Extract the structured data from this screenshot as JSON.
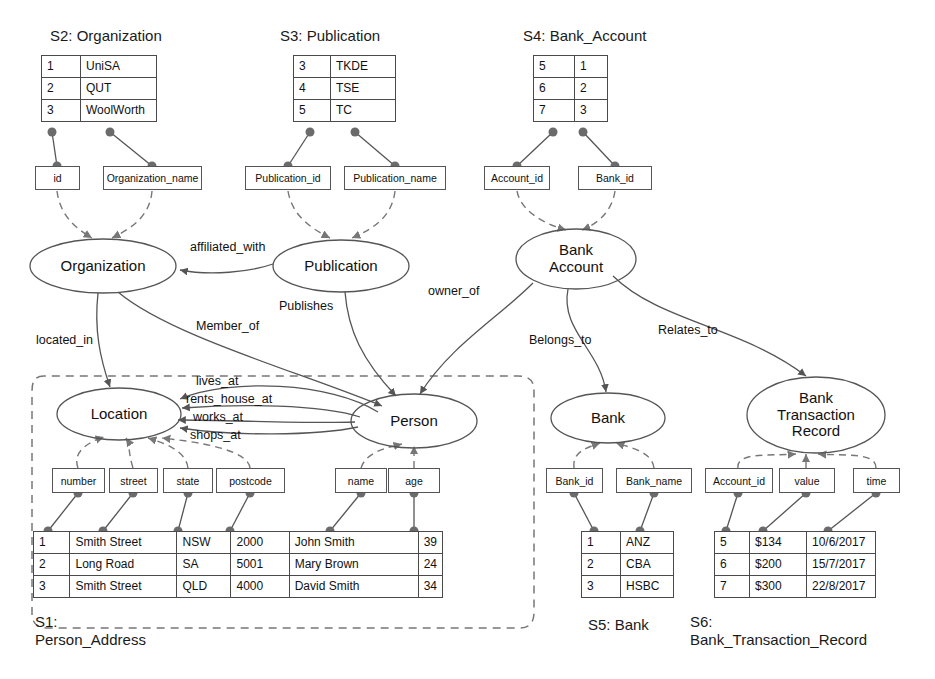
{
  "diagram": {
    "colors": {
      "stroke": "#555555",
      "node_dot": "#6b6b6b",
      "dashed": "#777777",
      "text": "#111111"
    }
  },
  "schemas": [
    {
      "id": "S1",
      "caption_line1": "S1:",
      "caption_line2": "Person_Address",
      "rows": [
        [
          "1",
          "Smith Street",
          "NSW",
          "2000",
          "John Smith",
          "39"
        ],
        [
          "2",
          "Long Road",
          "SA",
          "5001",
          "Mary Brown",
          "24"
        ],
        [
          "3",
          "Smith Street",
          "QLD",
          "4000",
          "David Smith",
          "34"
        ]
      ]
    },
    {
      "id": "S2",
      "caption": "S2: Organization",
      "rows": [
        [
          "1",
          "UniSA"
        ],
        [
          "2",
          "QUT"
        ],
        [
          "3",
          "WoolWorth"
        ]
      ]
    },
    {
      "id": "S3",
      "caption": "S3: Publication",
      "rows": [
        [
          "3",
          "TKDE"
        ],
        [
          "4",
          "TSE"
        ],
        [
          "5",
          "TC"
        ]
      ]
    },
    {
      "id": "S4",
      "caption": "S4: Bank_Account",
      "rows": [
        [
          "5",
          "1"
        ],
        [
          "6",
          "2"
        ],
        [
          "7",
          "3"
        ]
      ]
    },
    {
      "id": "S5",
      "caption": "S5: Bank",
      "rows": [
        [
          "1",
          "ANZ"
        ],
        [
          "2",
          "CBA"
        ],
        [
          "3",
          "HSBC"
        ]
      ]
    },
    {
      "id": "S6",
      "caption_line1": "S6:",
      "caption_line2": "Bank_Transaction_Record",
      "rows": [
        [
          "5",
          "$134",
          "10/6/2017"
        ],
        [
          "6",
          "$200",
          "15/7/2017"
        ],
        [
          "7",
          "$300",
          "22/8/2017"
        ]
      ]
    }
  ],
  "attributes": [
    {
      "key": "id",
      "label": "id"
    },
    {
      "key": "organization_name",
      "label": "Organization_name"
    },
    {
      "key": "publication_id",
      "label": "Publication_id"
    },
    {
      "key": "publication_name",
      "label": "Publication_name"
    },
    {
      "key": "account_id_top",
      "label": "Account_id"
    },
    {
      "key": "bank_id_top",
      "label": "Bank_id"
    },
    {
      "key": "number",
      "label": "number"
    },
    {
      "key": "street",
      "label": "street"
    },
    {
      "key": "state",
      "label": "state"
    },
    {
      "key": "postcode",
      "label": "postcode"
    },
    {
      "key": "name",
      "label": "name"
    },
    {
      "key": "age",
      "label": "age"
    },
    {
      "key": "bank_id",
      "label": "Bank_id"
    },
    {
      "key": "bank_name",
      "label": "Bank_name"
    },
    {
      "key": "account_id",
      "label": "Account_id"
    },
    {
      "key": "value",
      "label": "value"
    },
    {
      "key": "time",
      "label": "time"
    }
  ],
  "entities": [
    {
      "key": "organization",
      "label": "Organization"
    },
    {
      "key": "publication",
      "label": "Publication"
    },
    {
      "key": "bank_account",
      "label": "Bank\nAccount"
    },
    {
      "key": "location",
      "label": "Location"
    },
    {
      "key": "person",
      "label": "Person"
    },
    {
      "key": "bank",
      "label": "Bank"
    },
    {
      "key": "bank_transaction_record",
      "label": "Bank\nTransaction\nRecord"
    }
  ],
  "relationships": [
    {
      "key": "affiliated_with",
      "label": "affiliated_with",
      "from": "publication",
      "to": "organization"
    },
    {
      "key": "publishes",
      "label": "Publishes",
      "from": "publication",
      "to": "person"
    },
    {
      "key": "owner_of",
      "label": "owner_of",
      "from": "bank_account",
      "to": "person"
    },
    {
      "key": "located_in",
      "label": "located_in",
      "from": "organization",
      "to": "location"
    },
    {
      "key": "member_of",
      "label": "Member_of",
      "from": "organization",
      "to": "person"
    },
    {
      "key": "lives_at",
      "label": "lives_at",
      "from": "person",
      "to": "location"
    },
    {
      "key": "rents_house_at",
      "label": "rents_house_at",
      "from": "person",
      "to": "location"
    },
    {
      "key": "works_at",
      "label": "works_at",
      "from": "person",
      "to": "location"
    },
    {
      "key": "shops_at",
      "label": "shops_at",
      "from": "person",
      "to": "location"
    },
    {
      "key": "belongs_to",
      "label": "Belongs_to",
      "from": "bank_account",
      "to": "bank"
    },
    {
      "key": "relates_to",
      "label": "Relates_to",
      "from": "bank_account",
      "to": "bank_transaction_record"
    }
  ]
}
